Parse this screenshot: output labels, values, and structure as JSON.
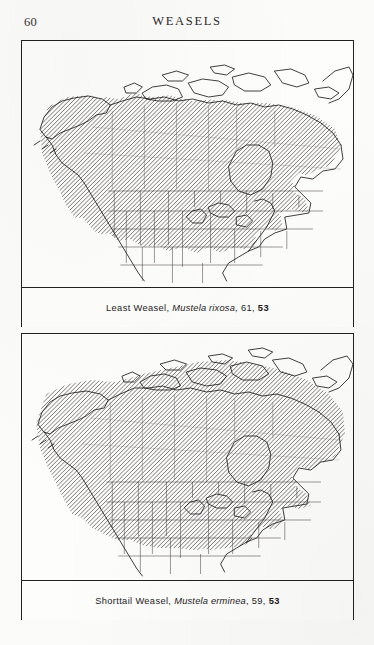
{
  "page": {
    "folio": "60",
    "running_head": "WEASELS",
    "background_color": "#fbfbfa",
    "ink_color": "#1f1d1c"
  },
  "figures": [
    {
      "id": "plate-1",
      "map_name": "least-weasel-range-map",
      "region": "North America",
      "caption": {
        "common_name": "Least Weasel,",
        "scientific_name": "Mustela rixosa",
        "separator_1": ",",
        "page_ref_text": "61",
        "separator_2": ",",
        "page_ref_bold": "53",
        "full_text": "Least Weasel, Mustela rixosa, 61, 53"
      },
      "range_description": "Shaded range covers Alaska, most of mainland Canada, the Great Lakes states, the upper Midwest, the Appalachians and the northern Great Plains; Arctic archipelago, far western United States and the Southeast are unshaded."
    },
    {
      "id": "plate-2",
      "map_name": "shorttail-weasel-range-map",
      "region": "North America",
      "caption": {
        "common_name": "Shorttail Weasel,",
        "scientific_name": "Mustela erminea",
        "separator_1": ",",
        "page_ref_text": "59",
        "separator_2": ",",
        "page_ref_bold": "53",
        "full_text": "Shorttail Weasel, Mustela erminea, 59, 53"
      },
      "range_description": "Shaded range covers Alaska, all of Canada including the Arctic islands and Greenland margin, the Rocky Mountain and Great Basin states, the Great Lakes region and the Northeast; the Southeast, southern Plains and California lowlands are unshaded."
    }
  ],
  "legend": {
    "shading_label": "hatched = species range",
    "hatch_color": "#4a4745"
  }
}
